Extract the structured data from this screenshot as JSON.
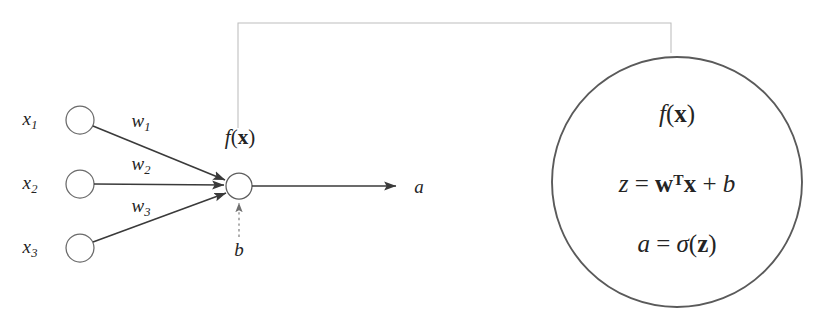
{
  "figure": {
    "type": "neural-network-neuron-diagram",
    "background_color": "#ffffff",
    "stroke_color": "#3a3a3a",
    "connector_color": "#b9b9b9",
    "text_color": "#242424"
  },
  "inputs": [
    {
      "label": "x",
      "subscript": "1",
      "cx": 80,
      "cy": 120,
      "r": 14,
      "label_x": 30,
      "label_y": 120
    },
    {
      "label": "x",
      "subscript": "2",
      "cx": 80,
      "cy": 184,
      "r": 14,
      "label_x": 30,
      "label_y": 184
    },
    {
      "label": "x",
      "subscript": "3",
      "cx": 80,
      "cy": 248,
      "r": 14,
      "label_x": 30,
      "label_y": 248
    }
  ],
  "weights": [
    {
      "label": "w",
      "subscript": "1",
      "x": 141,
      "y": 122
    },
    {
      "label": "w",
      "subscript": "2",
      "x": 141,
      "y": 165
    },
    {
      "label": "w",
      "subscript": "3",
      "x": 141,
      "y": 207
    }
  ],
  "neuron": {
    "cx": 239,
    "cy": 186,
    "r": 13,
    "label": "f(",
    "label_bold": "x",
    "label_close": ")",
    "label_x": 240,
    "label_y": 137
  },
  "bias": {
    "label": "b",
    "x": 239,
    "y": 249,
    "arrow_from_y": 235,
    "arrow_to_y": 202
  },
  "output": {
    "label": "a",
    "label_x": 419,
    "label_y": 186,
    "arrow_from_x": 252,
    "arrow_to_x": 396,
    "y": 186
  },
  "connector": {
    "start_x": 238,
    "start_y": 128,
    "top_y": 23,
    "corner_x": 671,
    "end_y": 53
  },
  "detail_circle": {
    "cx": 677,
    "cy": 182,
    "r": 125,
    "equations": [
      {
        "name": "function",
        "y": 113,
        "parts": [
          {
            "text": "f",
            "style": "italic"
          },
          {
            "text": "(",
            "style": "upright"
          },
          {
            "text": "x",
            "style": "bold"
          },
          {
            "text": ")",
            "style": "upright"
          }
        ]
      },
      {
        "name": "pre-activation",
        "y": 183,
        "parts": [
          {
            "text": "z",
            "style": "italic"
          },
          {
            "text": " = ",
            "style": "upright"
          },
          {
            "text": "w",
            "style": "bold"
          },
          {
            "text": "T",
            "style": "superscript"
          },
          {
            "text": "x",
            "style": "bold"
          },
          {
            "text": " + ",
            "style": "upright"
          },
          {
            "text": "b",
            "style": "italic"
          }
        ]
      },
      {
        "name": "activation",
        "y": 243,
        "parts": [
          {
            "text": "a",
            "style": "italic"
          },
          {
            "text": " = ",
            "style": "upright"
          },
          {
            "text": "σ",
            "style": "italic-greek"
          },
          {
            "text": "(",
            "style": "upright"
          },
          {
            "text": "z",
            "style": "bold"
          },
          {
            "text": ")",
            "style": "upright"
          }
        ]
      }
    ]
  },
  "labels": {
    "input_1": "x",
    "input_1_sub": "1",
    "input_2": "x",
    "input_2_sub": "2",
    "input_3": "x",
    "input_3_sub": "3",
    "weight_1": "w",
    "weight_1_sub": "1",
    "weight_2": "w",
    "weight_2_sub": "2",
    "weight_3": "w",
    "weight_3_sub": "3",
    "bias": "b",
    "output": "a",
    "neuron_f": "f",
    "paren_open": "(",
    "paren_close": ")",
    "bold_x": "x",
    "bold_w": "w",
    "bold_z": "z",
    "transpose": "T",
    "equals": " = ",
    "plus": " + ",
    "z_var": "z",
    "b_var": "b",
    "a_var": "a",
    "sigma": "σ"
  }
}
